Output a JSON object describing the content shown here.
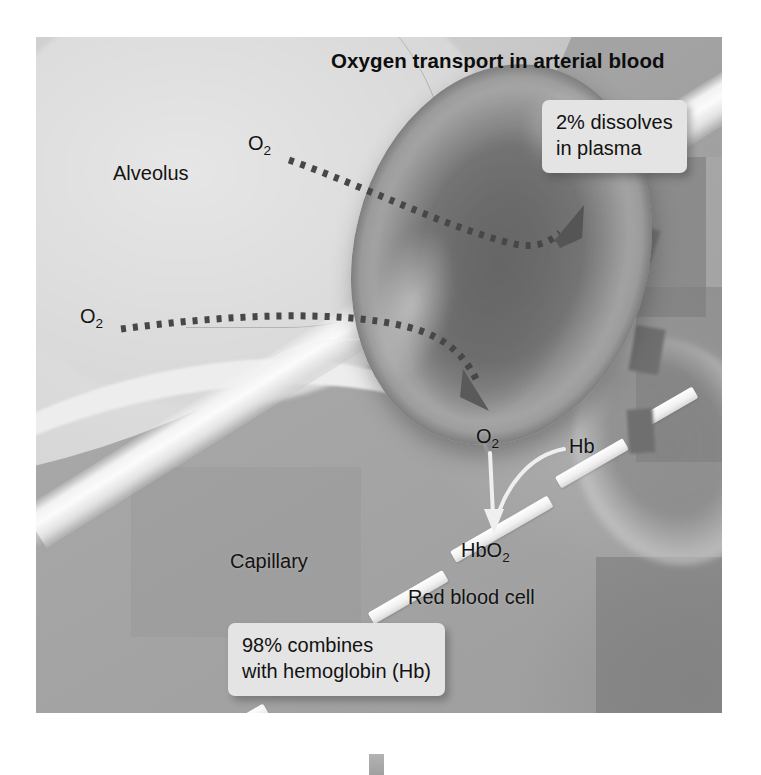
{
  "figure": {
    "title": "Oxygen transport in arterial blood",
    "labels": {
      "alveolus": "Alveolus",
      "capillary": "Capillary",
      "red_blood_cell": "Red blood cell",
      "o2_alveolar_upper": "O",
      "o2_alveolar_upper_sub": "2",
      "o2_alveolar_lower": "O",
      "o2_alveolar_lower_sub": "2",
      "o2_in_cell": "O",
      "o2_in_cell_sub": "2",
      "hb": "Hb",
      "hbo2": "HbO",
      "hbo2_sub": "2"
    },
    "callouts": {
      "plasma": {
        "line1": "2% dissolves",
        "line2": "in plasma"
      },
      "hemoglobin": {
        "line1": "98% combines",
        "line2": "with hemoglobin (Hb)"
      }
    },
    "colors": {
      "page_background": "#ffffff",
      "capillary_plasma": "#a6a6a6",
      "alveolus": "#d8d8d8",
      "membrane_highlight": "#f5f5f5",
      "red_blood_cell_rim": "#9a9a9a",
      "red_blood_cell_center": "#6d6d6d",
      "callout_background": "#e4e4e4",
      "text": "#121212",
      "dotted_arrow": "#4a4a4a",
      "white_arrow": "#f0f0f0"
    },
    "icons": {
      "diffusion_arrow": "dotted-arrow-icon",
      "binding_arrow": "curved-arrow-icon",
      "downward_arrow": "down-arrow-icon"
    }
  }
}
